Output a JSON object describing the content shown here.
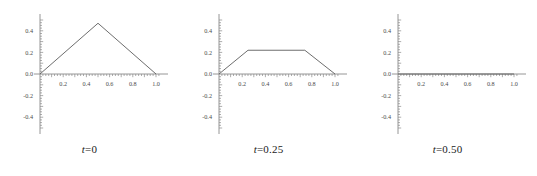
{
  "figure": {
    "background_color": "#ffffff",
    "axis_color": "#8a8a8a",
    "curve_color": "#5c5c5c",
    "label_color": "#4d4d4d"
  },
  "chart_data": [
    {
      "type": "line",
      "title": "",
      "caption_variable": "t",
      "caption_equals": "=",
      "caption_value": "0",
      "xlabel": "",
      "ylabel": "",
      "xlim": [
        -0.04,
        1.06
      ],
      "ylim": [
        -0.52,
        0.52
      ],
      "grid": false,
      "legend": false,
      "xticks": [
        0.2,
        0.4,
        0.6,
        0.8,
        1.0
      ],
      "xtick_labels": [
        "0.2",
        "0.4",
        "0.6",
        "0.8",
        "1.0"
      ],
      "yticks": [
        -0.4,
        -0.2,
        0.0,
        0.2,
        0.4
      ],
      "ytick_labels": [
        "-0.4",
        "-0.2",
        "0.0",
        "0.2",
        "0.4"
      ],
      "x": [
        0.0,
        0.5,
        1.0
      ],
      "values": [
        0.0,
        0.47,
        0.0
      ],
      "series": [
        {
          "name": "u(x,0)",
          "x": [
            0.0,
            0.5,
            1.0
          ],
          "values": [
            0.0,
            0.47,
            0.0
          ]
        }
      ]
    },
    {
      "type": "line",
      "title": "",
      "caption_variable": "t",
      "caption_equals": "=",
      "caption_value": "0.25",
      "xlabel": "",
      "ylabel": "",
      "xlim": [
        -0.04,
        1.06
      ],
      "ylim": [
        -0.52,
        0.52
      ],
      "grid": false,
      "legend": false,
      "xticks": [
        0.2,
        0.4,
        0.6,
        0.8,
        1.0
      ],
      "xtick_labels": [
        "0.2",
        "0.4",
        "0.6",
        "0.8",
        "1.0"
      ],
      "yticks": [
        -0.4,
        -0.2,
        0.0,
        0.2,
        0.4
      ],
      "ytick_labels": [
        "-0.4",
        "-0.2",
        "0.0",
        "0.2",
        "0.4"
      ],
      "x": [
        0.0,
        0.25,
        0.74,
        1.0
      ],
      "values": [
        0.0,
        0.22,
        0.22,
        0.0
      ],
      "series": [
        {
          "name": "u(x,0.25)",
          "x": [
            0.0,
            0.25,
            0.74,
            1.0
          ],
          "values": [
            0.0,
            0.22,
            0.22,
            0.0
          ]
        }
      ]
    },
    {
      "type": "line",
      "title": "",
      "caption_variable": "t",
      "caption_equals": "=",
      "caption_value": "0.50",
      "xlabel": "",
      "ylabel": "",
      "xlim": [
        -0.04,
        1.06
      ],
      "ylim": [
        -0.52,
        0.52
      ],
      "grid": false,
      "legend": false,
      "xticks": [
        0.2,
        0.4,
        0.6,
        0.8,
        1.0
      ],
      "xtick_labels": [
        "0.2",
        "0.4",
        "0.6",
        "0.8",
        "1.0"
      ],
      "yticks": [
        -0.4,
        -0.2,
        0.0,
        0.2,
        0.4
      ],
      "ytick_labels": [
        "-0.4",
        "-0.2",
        "0.0",
        "0.2",
        "0.4"
      ],
      "x": [
        0.0,
        1.0
      ],
      "values": [
        0.0,
        0.0
      ],
      "series": [
        {
          "name": "u(x,0.50)",
          "x": [
            0.0,
            1.0
          ],
          "values": [
            0.0,
            0.0
          ]
        }
      ]
    }
  ]
}
